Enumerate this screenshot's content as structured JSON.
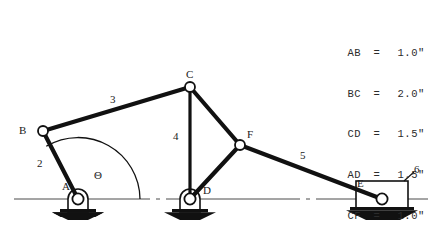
{
  "figure": {
    "stroke_color": "#111111",
    "ground_line_color": "#444444",
    "joint_fill": "#ffffff"
  },
  "dimensions": {
    "rows": [
      {
        "pair": "AB",
        "eq": "=",
        "value": "1.0\""
      },
      {
        "pair": "BC",
        "eq": "=",
        "value": "2.0\""
      },
      {
        "pair": "CD",
        "eq": "=",
        "value": "1.5\""
      },
      {
        "pair": "AD",
        "eq": "=",
        "value": "1.5\""
      },
      {
        "pair": "CF",
        "eq": "=",
        "value": "1.0\""
      },
      {
        "pair": "DF",
        "eq": "=",
        "value": "1.0\""
      }
    ]
  },
  "joints": {
    "A": {
      "label": "A",
      "x": 78,
      "y": 199,
      "type": "grounded-pivot"
    },
    "B": {
      "label": "B",
      "x": 43,
      "y": 131,
      "type": "pin"
    },
    "C": {
      "label": "C",
      "x": 190,
      "y": 87,
      "type": "pin"
    },
    "D": {
      "label": "D",
      "x": 190,
      "y": 199,
      "type": "grounded-pivot"
    },
    "F": {
      "label": "F",
      "x": 240,
      "y": 145,
      "type": "pin"
    },
    "E": {
      "label": "E",
      "x": 382,
      "y": 199,
      "type": "slider-pin"
    }
  },
  "links": {
    "two": {
      "label": "2",
      "from": "A",
      "to": "B"
    },
    "three": {
      "label": "3",
      "from": "B",
      "to": "C"
    },
    "four": {
      "label": "4",
      "from": "C",
      "to": "D"
    },
    "five": {
      "label": "5",
      "from": "F",
      "to": "E"
    },
    "six": {
      "label": "6",
      "from": "E",
      "to": "ground"
    }
  },
  "angle": {
    "symbol": "Θ",
    "at_joint": "A",
    "measured_from": "ground-horizontal",
    "to": "link-2"
  }
}
